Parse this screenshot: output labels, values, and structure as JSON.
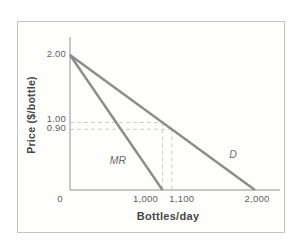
{
  "figure": {
    "background": "#ffffff",
    "frame_color": "#c3c3c3"
  },
  "chart_data": {
    "type": "line",
    "title": "",
    "xlabel": "Bottles/day",
    "ylabel": "Price ($/bottle)",
    "xlim": [
      0,
      2000
    ],
    "ylim": [
      0,
      2.0
    ],
    "grid": false,
    "legend": "none",
    "series": [
      {
        "name": "D",
        "label": "D",
        "points": [
          [
            0,
            2.0
          ],
          [
            2000,
            0
          ]
        ],
        "color": "#8c8c8c"
      },
      {
        "name": "MR",
        "label": "MR",
        "points": [
          [
            0,
            2.0
          ],
          [
            1000,
            0
          ]
        ],
        "color": "#8c8c8c"
      }
    ],
    "guides": [
      {
        "price": 1.0,
        "quantity": 1000
      },
      {
        "price": 0.9,
        "quantity": 1100
      }
    ],
    "guide_color": "#cccccc",
    "axis_color": "#b4b4b4",
    "text_color": "#5e5e5e",
    "title_color": "#474747",
    "yticks": [
      {
        "value": 2.0,
        "label": "2.00",
        "dy": -2
      },
      {
        "value": 1.0,
        "label": "1.00",
        "dy": -5
      },
      {
        "value": 0.9,
        "label": "0.90",
        "dy": -2
      }
    ],
    "xticks": [
      {
        "value": 0,
        "label": "0",
        "dx": -10
      },
      {
        "value": 1000,
        "label": "1,000",
        "dx": -17
      },
      {
        "value": 1100,
        "label": "1,100",
        "dx": 10
      },
      {
        "value": 2000,
        "label": "2,000",
        "dx": 2
      }
    ]
  }
}
